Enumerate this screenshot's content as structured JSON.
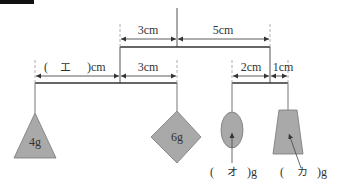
{
  "diagram": {
    "corner_marker_color": "#111111",
    "colors": {
      "line": "#333333",
      "weight_fill": "#a9a9a9",
      "weight_stroke": "#777777",
      "dashed": "#999999"
    },
    "upper_beam": {
      "left_dimension": "3cm",
      "right_dimension": "5cm"
    },
    "lower_left_beam": {
      "left_dimension_open": "(",
      "left_dimension_blank": "エ",
      "left_dimension_close": ")cm",
      "right_dimension": "3cm"
    },
    "lower_right_beam": {
      "left_dimension": "2cm",
      "right_dimension": "1cm"
    },
    "weights": {
      "triangle": {
        "label": "4g"
      },
      "diamond": {
        "label": "6g"
      },
      "ellipse": {
        "open": "(",
        "blank": "オ",
        "close": ")g"
      },
      "trapezoid": {
        "open": "(",
        "blank": "カ",
        "close": ")g"
      }
    }
  }
}
